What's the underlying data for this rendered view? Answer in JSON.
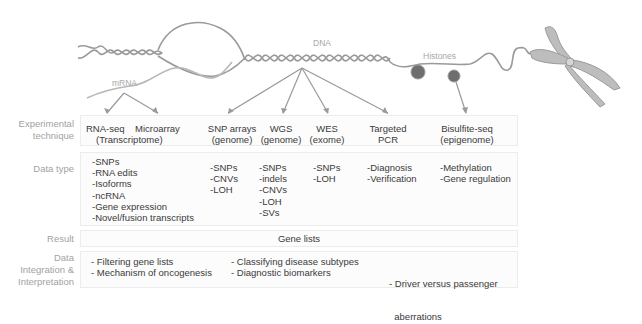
{
  "illustration": {
    "labels": {
      "dna": "DNA",
      "mrna": "mRNA",
      "histones": "Histones"
    }
  },
  "rows": {
    "technique": {
      "label_line1": "Experimental",
      "label_line2": "technique"
    },
    "data_type": {
      "label": "Data type"
    },
    "result": {
      "label": "Result"
    },
    "integration": {
      "label_line1": "Data",
      "label_line2": "Integration &",
      "label_line3": "Interpretation"
    }
  },
  "techniques": [
    {
      "name": "RNA-seq",
      "sub": ""
    },
    {
      "name": "Microarray",
      "sub": ""
    },
    {
      "name": "(Transcriptome)",
      "sub": ""
    },
    {
      "name": "SNP arrays",
      "sub": "(genome)"
    },
    {
      "name": "WGS",
      "sub": "(genome)"
    },
    {
      "name": "WES",
      "sub": "(exome)"
    },
    {
      "name": "Targeted",
      "sub": "PCR"
    },
    {
      "name": "Bisulfite-seq",
      "sub": "(epigenome)"
    }
  ],
  "data_types": {
    "transcriptome": [
      "-SNPs",
      "-RNA edits",
      "-Isoforms",
      "-ncRNA",
      "-Gene expression",
      "-Novel/fusion transcripts"
    ],
    "snp_arrays": [
      "-SNPs",
      "-CNVs",
      "-LOH"
    ],
    "wgs": [
      "-SNPs",
      "-indels",
      "-CNVs",
      "-LOH",
      "-SVs"
    ],
    "wes": [
      "-SNPs",
      "-LOH"
    ],
    "targeted_pcr": [
      "-Diagnosis",
      "-Verification"
    ],
    "bisulfite": [
      "-Methylation",
      "-Gene regulation"
    ]
  },
  "result": {
    "value": "Gene lists"
  },
  "integration": {
    "col1": [
      "- Filtering gene lists",
      "- Mechanism of oncogenesis"
    ],
    "col2": [
      "- Classifying disease subtypes",
      "- Diagnostic biomarkers"
    ],
    "col3": [
      "- Driver versus passenger",
      "  aberrations"
    ]
  }
}
